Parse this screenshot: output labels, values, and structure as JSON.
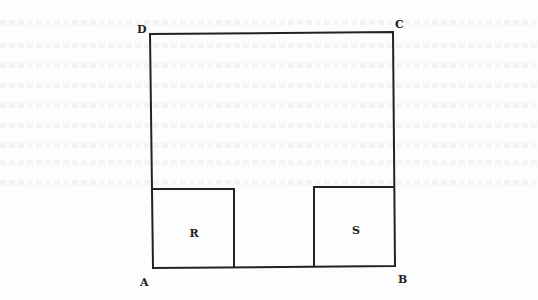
{
  "diagram": {
    "type": "geometry-figure",
    "vertices": {
      "A": {
        "label": "A",
        "x": 153,
        "y": 268
      },
      "B": {
        "label": "B",
        "x": 395,
        "y": 266
      },
      "C": {
        "label": "C",
        "x": 393,
        "y": 32
      },
      "D": {
        "label": "D",
        "x": 150,
        "y": 34
      }
    },
    "regions": {
      "R": {
        "label": "R",
        "x": 153,
        "y": 189,
        "width": 81,
        "height": 79
      },
      "S": {
        "label": "S",
        "x": 314,
        "y": 187,
        "width": 81,
        "height": 79
      }
    },
    "colors": {
      "line": "#222222",
      "label": "#222222",
      "background": "#fdfdfd"
    }
  }
}
